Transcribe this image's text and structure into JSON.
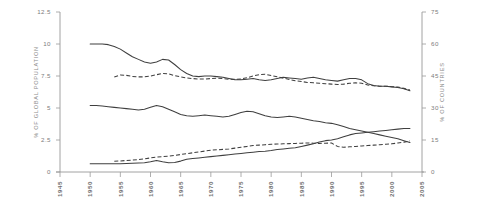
{
  "chart_data": {
    "type": "line",
    "title": "",
    "subtitle": "",
    "xlabel": "",
    "ylabel": "% OF GLOBAL POPULATION",
    "y2label": "% OF COUNTRIES",
    "grid": false,
    "legend": "none",
    "xlim": [
      1945,
      2005
    ],
    "ylim": [
      0,
      12.5
    ],
    "y2lim": [
      0,
      75
    ],
    "x_ticks": [
      1945,
      1950,
      1955,
      1960,
      1965,
      1970,
      1975,
      1980,
      1985,
      1990,
      1995,
      2000,
      2005
    ],
    "x_tick_labels": [
      "1945",
      "1950",
      "1955",
      "1960",
      "1965",
      "1970",
      "1975",
      "1980",
      "1985",
      "1990",
      "1995",
      "2000",
      "2005"
    ],
    "y_ticks": [
      0,
      2.5,
      5,
      7.5,
      10,
      12.5
    ],
    "y_tick_labels": [
      "0",
      "2.5",
      "5",
      "7.5",
      "10",
      "12.5"
    ],
    "y2_ticks": [
      0,
      15,
      30,
      45,
      60,
      75
    ],
    "y2_tick_labels": [
      "0",
      "15",
      "30",
      "45",
      "60",
      "75"
    ],
    "line_color": "#3f3f3f",
    "axis_color": "#8a8a8a",
    "background": "#ffffff",
    "series": [
      {
        "name": "series-1-solid-upper",
        "style": "solid",
        "axis": "left",
        "x": [
          1950,
          1951,
          1952,
          1953,
          1954,
          1955,
          1956,
          1957,
          1958,
          1959,
          1960,
          1961,
          1962,
          1963,
          1964,
          1965,
          1966,
          1967,
          1968,
          1969,
          1970,
          1971,
          1972,
          1973,
          1974,
          1975,
          1976,
          1977,
          1978,
          1979,
          1980,
          1981,
          1982,
          1983,
          1984,
          1985,
          1986,
          1987,
          1988,
          1989,
          1990,
          1991,
          1992,
          1993,
          1994,
          1995,
          1996,
          1997,
          1998,
          1999,
          2000,
          2001,
          2002,
          2003
        ],
        "y": [
          10.0,
          10.0,
          10.0,
          9.95,
          9.8,
          9.6,
          9.3,
          9.0,
          8.8,
          8.6,
          8.5,
          8.6,
          8.8,
          8.75,
          8.4,
          8.0,
          7.7,
          7.5,
          7.45,
          7.5,
          7.5,
          7.45,
          7.4,
          7.3,
          7.2,
          7.2,
          7.25,
          7.3,
          7.2,
          7.15,
          7.2,
          7.3,
          7.4,
          7.35,
          7.3,
          7.25,
          7.35,
          7.4,
          7.3,
          7.2,
          7.15,
          7.1,
          7.2,
          7.3,
          7.3,
          7.2,
          6.9,
          6.75,
          6.7,
          6.7,
          6.65,
          6.6,
          6.5,
          6.35
        ]
      },
      {
        "name": "series-2-dashed-upper",
        "style": "dashed",
        "axis": "right",
        "x": [
          1954,
          1955,
          1956,
          1957,
          1958,
          1959,
          1960,
          1961,
          1962,
          1963,
          1964,
          1965,
          1966,
          1967,
          1968,
          1969,
          1970,
          1971,
          1972,
          1973,
          1974,
          1975,
          1976,
          1977,
          1978,
          1979,
          1980,
          1981,
          1982,
          1983,
          1984,
          1985,
          1986,
          1987,
          1988,
          1989,
          1990,
          1991,
          1992,
          1993,
          1994,
          1995,
          1996,
          1997,
          1998,
          1999,
          2000,
          2001,
          2002,
          2003
        ],
        "y": [
          44.5,
          45.5,
          45.3,
          44.8,
          44.6,
          44.6,
          45.0,
          45.6,
          46.2,
          46.0,
          45.2,
          44.6,
          44.1,
          43.8,
          43.6,
          43.6,
          43.8,
          44.0,
          43.8,
          43.5,
          43.4,
          43.6,
          44.2,
          45.0,
          45.6,
          45.8,
          45.2,
          44.6,
          44.0,
          43.4,
          42.8,
          42.4,
          42.0,
          41.8,
          41.6,
          41.4,
          41.2,
          41.0,
          41.2,
          41.6,
          41.8,
          41.6,
          40.8,
          40.4,
          40.2,
          40.2,
          40.0,
          39.8,
          39.2,
          38.4
        ]
      },
      {
        "name": "series-3-solid-middle",
        "style": "solid",
        "axis": "left",
        "x": [
          1950,
          1951,
          1952,
          1953,
          1954,
          1955,
          1956,
          1957,
          1958,
          1959,
          1960,
          1961,
          1962,
          1963,
          1964,
          1965,
          1966,
          1967,
          1968,
          1969,
          1970,
          1971,
          1972,
          1973,
          1974,
          1975,
          1976,
          1977,
          1978,
          1979,
          1980,
          1981,
          1982,
          1983,
          1984,
          1985,
          1986,
          1987,
          1988,
          1989,
          1990,
          1991,
          1992,
          1993,
          1994,
          1995,
          1996,
          1997,
          1998,
          1999,
          2000,
          2001,
          2002,
          2003
        ],
        "y": [
          5.2,
          5.2,
          5.15,
          5.1,
          5.05,
          5.0,
          4.95,
          4.9,
          4.85,
          4.9,
          5.05,
          5.2,
          5.1,
          4.9,
          4.7,
          4.5,
          4.4,
          4.35,
          4.4,
          4.45,
          4.4,
          4.35,
          4.3,
          4.35,
          4.5,
          4.65,
          4.75,
          4.7,
          4.55,
          4.4,
          4.3,
          4.25,
          4.3,
          4.35,
          4.3,
          4.2,
          4.1,
          4.0,
          3.95,
          3.85,
          3.8,
          3.7,
          3.55,
          3.4,
          3.3,
          3.2,
          3.1,
          3.0,
          2.9,
          2.8,
          2.7,
          2.6,
          2.45,
          2.3
        ]
      },
      {
        "name": "series-4-solid-lower",
        "style": "solid",
        "axis": "left",
        "x": [
          1950,
          1951,
          1952,
          1953,
          1954,
          1955,
          1956,
          1957,
          1958,
          1959,
          1960,
          1961,
          1962,
          1963,
          1964,
          1965,
          1966,
          1967,
          1968,
          1969,
          1970,
          1971,
          1972,
          1973,
          1974,
          1975,
          1976,
          1977,
          1978,
          1979,
          1980,
          1981,
          1982,
          1983,
          1984,
          1985,
          1986,
          1987,
          1988,
          1989,
          1990,
          1991,
          1992,
          1993,
          1994,
          1995,
          1996,
          1997,
          1998,
          1999,
          2000,
          2001,
          2002,
          2003
        ],
        "y": [
          0.65,
          0.65,
          0.65,
          0.65,
          0.65,
          0.65,
          0.66,
          0.68,
          0.7,
          0.72,
          0.8,
          0.9,
          0.8,
          0.72,
          0.75,
          0.85,
          1.0,
          1.05,
          1.1,
          1.15,
          1.2,
          1.25,
          1.3,
          1.35,
          1.4,
          1.45,
          1.5,
          1.55,
          1.6,
          1.62,
          1.68,
          1.75,
          1.8,
          1.85,
          1.9,
          2.0,
          2.1,
          2.2,
          2.35,
          2.45,
          2.5,
          2.6,
          2.75,
          2.9,
          3.0,
          3.05,
          3.1,
          3.15,
          3.2,
          3.25,
          3.3,
          3.35,
          3.4,
          3.4
        ]
      },
      {
        "name": "series-5-dashed-lower",
        "style": "dashed",
        "axis": "right",
        "x": [
          1954,
          1955,
          1956,
          1957,
          1958,
          1959,
          1960,
          1961,
          1962,
          1963,
          1964,
          1965,
          1966,
          1967,
          1968,
          1969,
          1970,
          1971,
          1972,
          1973,
          1974,
          1975,
          1976,
          1977,
          1978,
          1979,
          1980,
          1981,
          1982,
          1983,
          1984,
          1985,
          1986,
          1987,
          1988,
          1989,
          1990,
          1991,
          1992,
          1993,
          1994,
          1995,
          1996,
          1997,
          1998,
          1999,
          2000,
          2001,
          2002,
          2003
        ],
        "y": [
          5.0,
          5.2,
          5.4,
          5.6,
          5.8,
          6.2,
          6.6,
          7.0,
          7.2,
          7.4,
          7.8,
          8.2,
          8.6,
          9.0,
          9.4,
          9.8,
          10.2,
          10.4,
          10.6,
          10.8,
          11.2,
          11.6,
          12.0,
          12.4,
          12.6,
          12.8,
          13.0,
          13.1,
          13.2,
          13.3,
          13.4,
          13.5,
          13.6,
          13.5,
          13.4,
          13.5,
          13.6,
          12.0,
          11.6,
          11.8,
          12.0,
          12.2,
          12.4,
          12.6,
          12.8,
          13.0,
          13.2,
          13.6,
          14.0,
          14.6
        ]
      }
    ]
  }
}
